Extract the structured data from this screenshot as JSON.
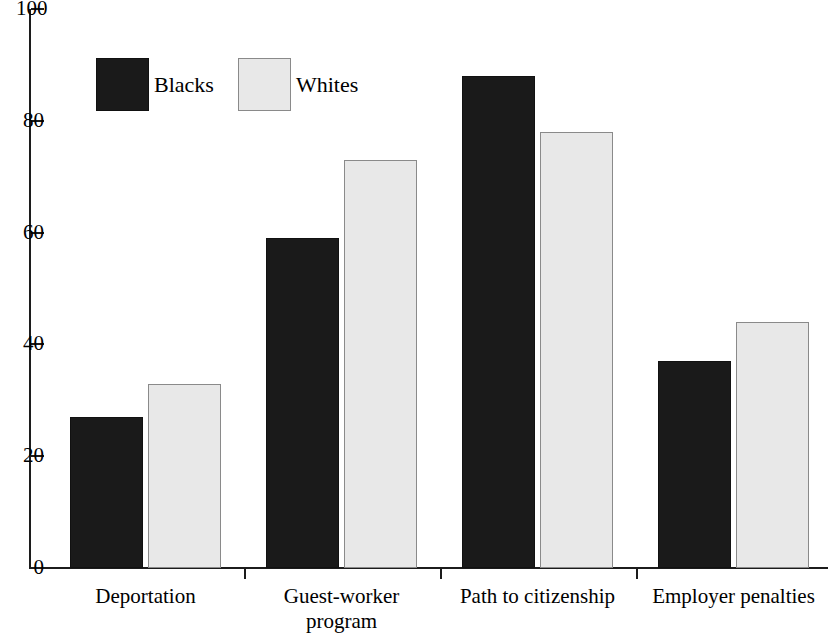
{
  "chart_data": {
    "type": "bar",
    "title": "",
    "subtitle": "",
    "xlabel": "",
    "ylabel": "",
    "ylim": [
      0,
      100
    ],
    "yticks": [
      0,
      20,
      40,
      60,
      80,
      100
    ],
    "ytick_labels": [
      "0",
      "20",
      "40",
      "60",
      "80",
      "100"
    ],
    "grid": false,
    "legend_position": "top-left",
    "grouped": true,
    "categories": [
      "Deportation",
      "Guest-worker\nprogram",
      "Path to citizenship",
      "Employer penalties"
    ],
    "series": [
      {
        "name": "Blacks",
        "color": "#1a1a1a",
        "values": [
          27,
          59,
          88,
          37
        ]
      },
      {
        "name": "Whites",
        "color": "#e8e8e8",
        "values": [
          33,
          73,
          78,
          44
        ]
      }
    ]
  },
  "legend": {
    "entries": [
      {
        "label": "Blacks",
        "swatch": "series-blacks"
      },
      {
        "label": "Whites",
        "swatch": "series-whites"
      }
    ]
  },
  "axes": {
    "y_tick_labels": [
      "100",
      "80",
      "60",
      "40",
      "20",
      "0"
    ],
    "y_tick_values": [
      100,
      80,
      60,
      40,
      20,
      0
    ]
  },
  "colors": {
    "blacks_fill": "#1a1a1a",
    "whites_fill": "#e8e8e8",
    "whites_border": "#8a8a8a",
    "axis": "#1c1c1c",
    "background": "#ffffff"
  }
}
